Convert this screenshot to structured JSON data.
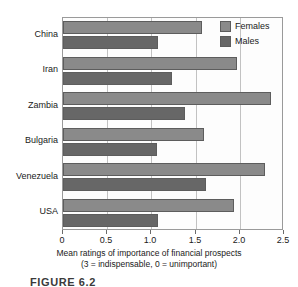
{
  "chart_data": {
    "type": "bar",
    "orientation": "horizontal",
    "title": "",
    "xlabel": "Mean ratings of importance of financial prospects",
    "xlabel_note": "(3 = indispensable, 0 = unimportant)",
    "ylabel": "",
    "categories": [
      "China",
      "Iran",
      "Zambia",
      "Bulgaria",
      "Venezuela",
      "USA"
    ],
    "series": [
      {
        "name": "Females",
        "color": "#8a8a8a",
        "values": [
          1.57,
          1.97,
          2.35,
          1.59,
          2.29,
          1.93
        ]
      },
      {
        "name": "Males",
        "color": "#676767",
        "values": [
          1.08,
          1.23,
          1.38,
          1.06,
          1.62,
          1.07
        ]
      }
    ],
    "xlim": [
      0,
      2.5
    ],
    "xticks": [
      0,
      0.5,
      1.0,
      1.5,
      2.0,
      2.5
    ],
    "xticklabels": [
      "0",
      "0.5",
      "1.0",
      "1.5",
      "2.0",
      "2.5"
    ],
    "grid": true,
    "grid_axis": "x",
    "legend_position": "top-right"
  },
  "legend": {
    "items": [
      {
        "label": "Females"
      },
      {
        "label": "Males"
      }
    ]
  },
  "caption": {
    "text": "FIGURE 6.2"
  },
  "colors": {
    "females": "#8a8a8a",
    "males": "#676767",
    "axis": "#9a9a9a",
    "grid": "#c2c2c2",
    "text": "#1a1a1a"
  }
}
